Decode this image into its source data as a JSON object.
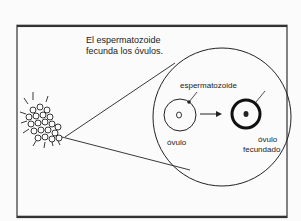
{
  "diagram": {
    "caption_line1": "El espermatozoide",
    "caption_line2": "fecunda los óvulos.",
    "labels": {
      "sperm": "espermatozoide",
      "ovum": "óvulo",
      "fertilized_line1": "óvulo",
      "fertilized_line2": "fecundado"
    },
    "colors": {
      "stroke": "#222222",
      "background": "#fbfbfb"
    }
  }
}
